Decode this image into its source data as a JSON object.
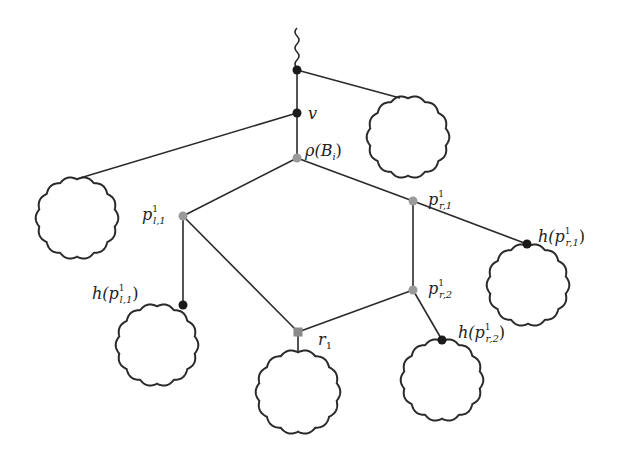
{
  "diagram": {
    "title": "",
    "colors": {
      "edge": "#2a2a2a",
      "black_node": "#1a1a1a",
      "gray_node": "#9a9a9a",
      "background": "#ffffff"
    },
    "nodes": [
      {
        "id": "top",
        "x": 297,
        "y": 70,
        "style": "black-circle",
        "label": ""
      },
      {
        "id": "v",
        "x": 297,
        "y": 113,
        "style": "black-circle",
        "label": "v"
      },
      {
        "id": "rho",
        "x": 297,
        "y": 158,
        "style": "gray-circle",
        "label": "ρ(B_i)"
      },
      {
        "id": "p_l1",
        "x": 183,
        "y": 216,
        "style": "gray-circle",
        "label": "p^1_{l,1}"
      },
      {
        "id": "p_r1",
        "x": 413,
        "y": 201,
        "style": "gray-circle",
        "label": "p^1_{r,1}"
      },
      {
        "id": "p_r2",
        "x": 413,
        "y": 290,
        "style": "gray-circle",
        "label": "p^1_{r,2}"
      },
      {
        "id": "r1",
        "x": 298,
        "y": 332,
        "style": "gray-square",
        "label": "r_1"
      },
      {
        "id": "h_pl1",
        "x": 183,
        "y": 305,
        "style": "black-circle",
        "label": "h(p^1_{l,1})"
      },
      {
        "id": "h_pr1",
        "x": 527,
        "y": 244,
        "style": "black-circle",
        "label": "h(p^1_{r,1})"
      },
      {
        "id": "h_pr2",
        "x": 442,
        "y": 340,
        "style": "black-circle",
        "label": "h(p^1_{r,2})"
      }
    ],
    "edges": [
      [
        "top",
        "v"
      ],
      [
        "v",
        "rho"
      ],
      [
        "rho",
        "p_l1"
      ],
      [
        "rho",
        "p_r1"
      ],
      [
        "p_l1",
        "r1"
      ],
      [
        "p_r1",
        "p_r2"
      ],
      [
        "p_r2",
        "r1"
      ],
      [
        "p_l1",
        "h_pl1"
      ],
      [
        "p_r1",
        "h_pr1"
      ],
      [
        "p_r2",
        "h_pr2"
      ],
      [
        "top",
        "blob_top_right"
      ],
      [
        "v",
        "blob_left_top"
      ],
      [
        "r1",
        "blob_bottom"
      ]
    ],
    "blobs": [
      {
        "id": "blob_top_right",
        "cx": 408,
        "cy": 137,
        "r": 40
      },
      {
        "id": "blob_left_top",
        "cx": 77,
        "cy": 218,
        "r": 40
      },
      {
        "id": "blob_left_bottom",
        "cx": 157,
        "cy": 345,
        "r": 40
      },
      {
        "id": "blob_right",
        "cx": 528,
        "cy": 285,
        "r": 40
      },
      {
        "id": "blob_right_bottom",
        "cx": 442,
        "cy": 380,
        "r": 40
      },
      {
        "id": "blob_bottom",
        "cx": 298,
        "cy": 392,
        "r": 41
      }
    ],
    "labels": {
      "v": {
        "base": "v"
      },
      "rho": {
        "base": "ρ(B",
        "sub": "i",
        "tail": ")"
      },
      "p_l1": {
        "base": "p",
        "sup": "1",
        "sub": "l,1"
      },
      "p_r1": {
        "base": "p",
        "sup": "1",
        "sub": "r,1"
      },
      "p_r2": {
        "base": "p",
        "sup": "1",
        "sub": "r,2"
      },
      "r1": {
        "base": "r",
        "sub": "1"
      },
      "h_pl1": {
        "base": "h(p",
        "sup": "1",
        "sub": "l,1",
        "tail": ")"
      },
      "h_pr1": {
        "base": "h(p",
        "sup": "1",
        "sub": "r,1",
        "tail": ")"
      },
      "h_pr2": {
        "base": "h(p",
        "sup": "1",
        "sub": "r,2",
        "tail": ")"
      }
    }
  }
}
